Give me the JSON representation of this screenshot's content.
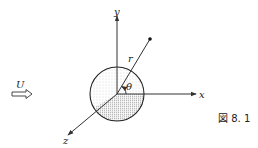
{
  "figure": {
    "caption": "図 8. 1",
    "labels": {
      "x_axis": "x",
      "y_axis": "y",
      "z_axis": "z",
      "radius": "r",
      "angle": "θ",
      "flow": "U"
    },
    "elements": [
      "sphere (stippled)",
      "x-axis arrow",
      "y-axis arrow",
      "z-axis arrow",
      "radial line r to point",
      "angle θ between r and x-axis",
      "uniform flow arrow U"
    ]
  }
}
